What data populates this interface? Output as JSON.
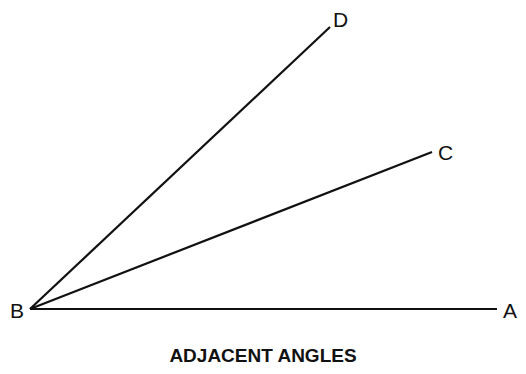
{
  "diagram": {
    "title": "ADJACENT ANGLES",
    "vertex": {
      "label": "B",
      "x": 30,
      "y": 309
    },
    "rays": [
      {
        "label": "A",
        "end_x": 497,
        "end_y": 309
      },
      {
        "label": "C",
        "end_x": 432,
        "end_y": 152
      },
      {
        "label": "D",
        "end_x": 330,
        "end_y": 27
      }
    ],
    "colors": {
      "line": "#111111",
      "background": "#ffffff"
    }
  }
}
